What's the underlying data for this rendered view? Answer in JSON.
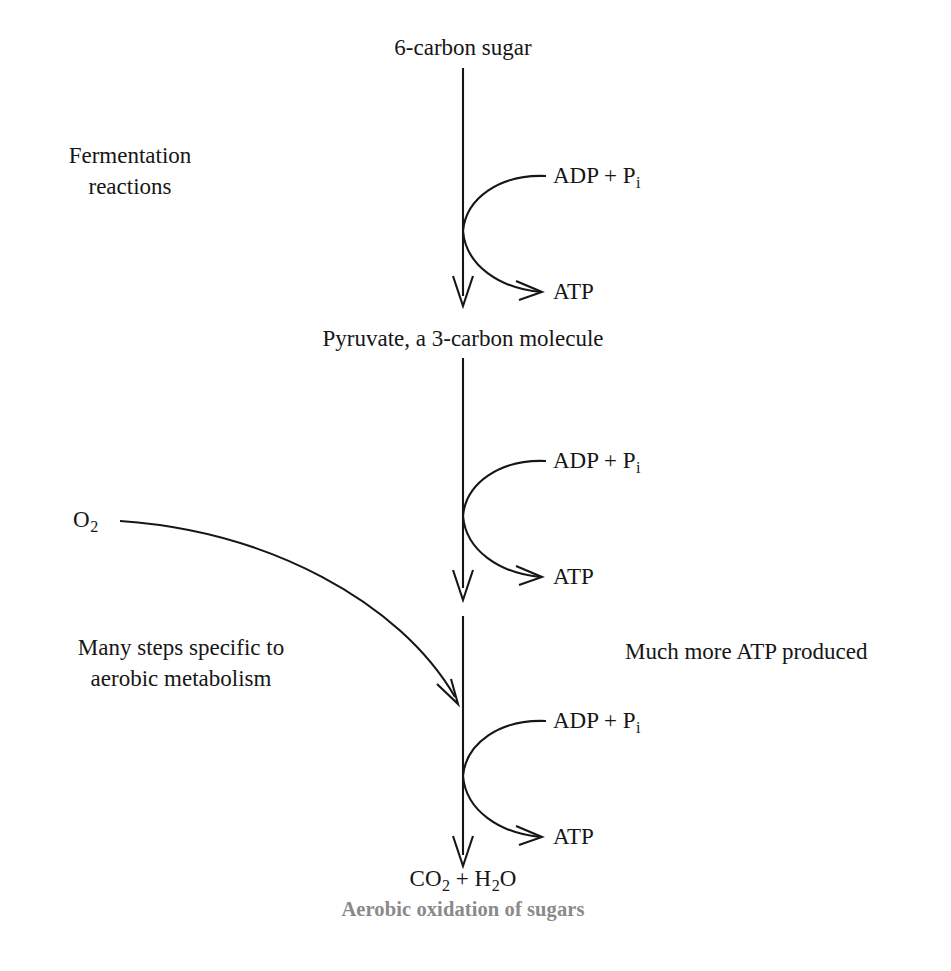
{
  "diagram": {
    "title": "Aerobic oxidation of sugars",
    "caption": "Aerobic oxidation of sugars",
    "line_color": "#161616",
    "text_color": "#161616",
    "caption_color": "#8a8a8a",
    "background": "#ffffff"
  },
  "nodes": {
    "start": "6-carbon sugar",
    "intermediate": "Pyruvate, a 3-carbon molecule",
    "product_prefix": "CO",
    "product_sub1": "2",
    "product_middle": " + H",
    "product_sub2": "2",
    "product_suffix": "O",
    "product_plain": "CO2 + H2O"
  },
  "annotations": {
    "fermentation_line1": "Fermentation",
    "fermentation_line2": "reactions",
    "oxygen_symbol": "O",
    "oxygen_sub": "2",
    "oxygen_plain": "O2",
    "many_steps_line1": "Many steps specific to",
    "many_steps_line2": "aerobic metabolism",
    "much_more_atp": "Much more ATP produced"
  },
  "cofactors": [
    {
      "input_prefix": "ADP + P",
      "input_sub": "i",
      "input_plain": "ADP + Pi",
      "output": "ATP",
      "stage": "glycolysis"
    },
    {
      "input_prefix": "ADP + P",
      "input_sub": "i",
      "input_plain": "ADP + Pi",
      "output": "ATP",
      "stage": "citric-acid-cycle"
    },
    {
      "input_prefix": "ADP + P",
      "input_sub": "i",
      "input_plain": "ADP + Pi",
      "output": "ATP",
      "stage": "oxidative-phosphorylation"
    }
  ]
}
